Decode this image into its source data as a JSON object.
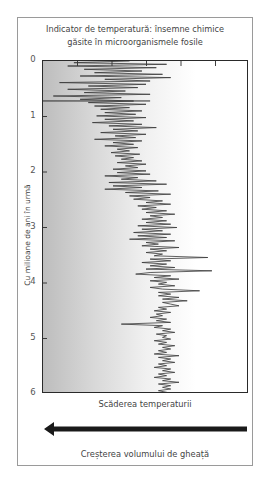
{
  "chart_data": {
    "type": "line",
    "title": "Indicator de temperatură: însemne chimice găsite în microorganismele fosile",
    "title_lines": [
      "Indicator de temperatură: însemne chimice",
      "găsite în microorganismele fosile"
    ],
    "ylabel": "Cu milioane de ani în urmă",
    "xlabel": "Scăderea temperaturii",
    "xlabel_secondary": "Creșterea volumului de gheață",
    "arrow_direction": "left",
    "y_ticks": [
      0,
      1,
      2,
      3,
      4,
      5,
      6
    ],
    "ylim": [
      0,
      6
    ],
    "y_inverted": true,
    "x_ticks_count": 5,
    "x_tick_labels": [],
    "xlim": [
      0,
      100
    ],
    "x_note": "x is relative proxy position (0 = left edge/colder, 100 = right edge/warmer), no numeric labels shown",
    "grid": false,
    "background": "left-to-right gray gradient",
    "reference_line": {
      "y": 0.72,
      "x_start": 0,
      "x_end": 52
    },
    "series": [
      {
        "name": "temperature proxy",
        "color": "#3a3a3a",
        "points": [
          [
            0.0,
            42
          ],
          [
            0.03,
            15
          ],
          [
            0.06,
            60
          ],
          [
            0.09,
            12
          ],
          [
            0.12,
            55
          ],
          [
            0.15,
            20
          ],
          [
            0.18,
            48
          ],
          [
            0.21,
            25
          ],
          [
            0.24,
            58
          ],
          [
            0.27,
            18
          ],
          [
            0.3,
            62
          ],
          [
            0.33,
            30
          ],
          [
            0.36,
            52
          ],
          [
            0.39,
            8
          ],
          [
            0.42,
            50
          ],
          [
            0.45,
            22
          ],
          [
            0.48,
            46
          ],
          [
            0.51,
            12
          ],
          [
            0.54,
            40
          ],
          [
            0.57,
            20
          ],
          [
            0.6,
            52
          ],
          [
            0.63,
            5
          ],
          [
            0.66,
            38
          ],
          [
            0.69,
            18
          ],
          [
            0.72,
            44
          ],
          [
            0.75,
            22
          ],
          [
            0.78,
            50
          ],
          [
            0.81,
            25
          ],
          [
            0.84,
            42
          ],
          [
            0.87,
            28
          ],
          [
            0.9,
            48
          ],
          [
            0.93,
            30
          ],
          [
            0.96,
            45
          ],
          [
            0.99,
            26
          ],
          [
            1.02,
            50
          ],
          [
            1.05,
            30
          ],
          [
            1.08,
            44
          ],
          [
            1.11,
            24
          ],
          [
            1.14,
            48
          ],
          [
            1.17,
            32
          ],
          [
            1.2,
            55
          ],
          [
            1.23,
            34
          ],
          [
            1.26,
            46
          ],
          [
            1.29,
            28
          ],
          [
            1.32,
            50
          ],
          [
            1.35,
            35
          ],
          [
            1.38,
            45
          ],
          [
            1.41,
            25
          ],
          [
            1.44,
            48
          ],
          [
            1.47,
            34
          ],
          [
            1.5,
            44
          ],
          [
            1.53,
            30
          ],
          [
            1.56,
            46
          ],
          [
            1.59,
            36
          ],
          [
            1.62,
            42
          ],
          [
            1.65,
            33
          ],
          [
            1.68,
            47
          ],
          [
            1.71,
            35
          ],
          [
            1.74,
            44
          ],
          [
            1.77,
            38
          ],
          [
            1.8,
            48
          ],
          [
            1.83,
            36
          ],
          [
            1.86,
            50
          ],
          [
            1.89,
            40
          ],
          [
            1.92,
            46
          ],
          [
            1.95,
            34
          ],
          [
            1.98,
            50
          ],
          [
            2.01,
            36
          ],
          [
            2.04,
            52
          ],
          [
            2.07,
            30
          ],
          [
            2.1,
            46
          ],
          [
            2.13,
            38
          ],
          [
            2.16,
            55
          ],
          [
            2.19,
            32
          ],
          [
            2.22,
            60
          ],
          [
            2.25,
            34
          ],
          [
            2.28,
            48
          ],
          [
            2.31,
            30
          ],
          [
            2.34,
            56
          ],
          [
            2.37,
            40
          ],
          [
            2.4,
            62
          ],
          [
            2.43,
            42
          ],
          [
            2.46,
            52
          ],
          [
            2.49,
            44
          ],
          [
            2.52,
            58
          ],
          [
            2.55,
            50
          ],
          [
            2.58,
            62
          ],
          [
            2.61,
            46
          ],
          [
            2.64,
            55
          ],
          [
            2.67,
            48
          ],
          [
            2.7,
            60
          ],
          [
            2.73,
            50
          ],
          [
            2.76,
            64
          ],
          [
            2.79,
            52
          ],
          [
            2.82,
            58
          ],
          [
            2.85,
            48
          ],
          [
            2.88,
            60
          ],
          [
            2.91,
            50
          ],
          [
            2.94,
            62
          ],
          [
            2.97,
            46
          ],
          [
            3.0,
            65
          ],
          [
            3.03,
            48
          ],
          [
            3.06,
            58
          ],
          [
            3.09,
            44
          ],
          [
            3.12,
            62
          ],
          [
            3.15,
            46
          ],
          [
            3.18,
            60
          ],
          [
            3.21,
            42
          ],
          [
            3.24,
            64
          ],
          [
            3.27,
            50
          ],
          [
            3.3,
            56
          ],
          [
            3.33,
            48
          ],
          [
            3.36,
            66
          ],
          [
            3.39,
            52
          ],
          [
            3.42,
            60
          ],
          [
            3.45,
            50
          ],
          [
            3.48,
            58
          ],
          [
            3.51,
            54
          ],
          [
            3.54,
            80
          ],
          [
            3.57,
            52
          ],
          [
            3.6,
            62
          ],
          [
            3.63,
            48
          ],
          [
            3.66,
            60
          ],
          [
            3.69,
            52
          ],
          [
            3.72,
            64
          ],
          [
            3.75,
            50
          ],
          [
            3.78,
            82
          ],
          [
            3.81,
            52
          ],
          [
            3.84,
            45
          ],
          [
            3.87,
            62
          ],
          [
            3.9,
            54
          ],
          [
            3.93,
            66
          ],
          [
            3.96,
            52
          ],
          [
            3.99,
            60
          ],
          [
            4.02,
            56
          ],
          [
            4.05,
            64
          ],
          [
            4.08,
            52
          ],
          [
            4.11,
            58
          ],
          [
            4.14,
            76
          ],
          [
            4.17,
            56
          ],
          [
            4.2,
            62
          ],
          [
            4.23,
            56
          ],
          [
            4.26,
            66
          ],
          [
            4.29,
            58
          ],
          [
            4.32,
            70
          ],
          [
            4.35,
            58
          ],
          [
            4.38,
            62
          ],
          [
            4.41,
            66
          ],
          [
            4.44,
            56
          ],
          [
            4.47,
            60
          ],
          [
            4.5,
            54
          ],
          [
            4.53,
            62
          ],
          [
            4.56,
            55
          ],
          [
            4.59,
            58
          ],
          [
            4.62,
            52
          ],
          [
            4.65,
            60
          ],
          [
            4.68,
            55
          ],
          [
            4.71,
            62
          ],
          [
            4.74,
            38
          ],
          [
            4.77,
            58
          ],
          [
            4.8,
            54
          ],
          [
            4.83,
            62
          ],
          [
            4.86,
            58
          ],
          [
            4.89,
            64
          ],
          [
            4.92,
            55
          ],
          [
            4.95,
            60
          ],
          [
            4.98,
            58
          ],
          [
            5.01,
            62
          ],
          [
            5.04,
            54
          ],
          [
            5.07,
            60
          ],
          [
            5.1,
            56
          ],
          [
            5.13,
            64
          ],
          [
            5.16,
            58
          ],
          [
            5.19,
            62
          ],
          [
            5.22,
            56
          ],
          [
            5.25,
            60
          ],
          [
            5.28,
            54
          ],
          [
            5.31,
            66
          ],
          [
            5.34,
            56
          ],
          [
            5.37,
            62
          ],
          [
            5.4,
            58
          ],
          [
            5.43,
            64
          ],
          [
            5.46,
            56
          ],
          [
            5.49,
            60
          ],
          [
            5.52,
            54
          ],
          [
            5.55,
            62
          ],
          [
            5.58,
            58
          ],
          [
            5.61,
            64
          ],
          [
            5.64,
            56
          ],
          [
            5.67,
            60
          ],
          [
            5.7,
            54
          ],
          [
            5.73,
            62
          ],
          [
            5.76,
            58
          ],
          [
            5.79,
            66
          ],
          [
            5.82,
            56
          ],
          [
            5.85,
            62
          ],
          [
            5.88,
            58
          ],
          [
            5.91,
            62
          ],
          [
            5.94,
            56
          ],
          [
            5.97,
            60
          ],
          [
            6.0,
            58
          ]
        ]
      }
    ]
  }
}
